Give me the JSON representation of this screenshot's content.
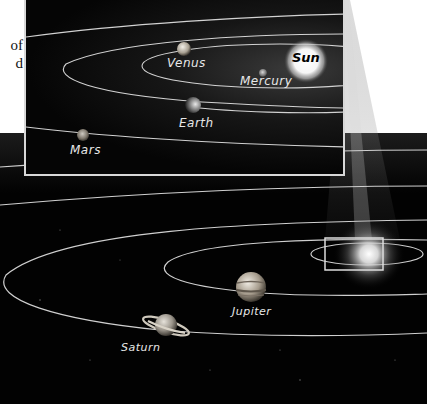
{
  "page_text": {
    "line1": "of",
    "line2": "d"
  },
  "inset": {
    "title": "Inner solar system",
    "labels": {
      "sun": "Sun",
      "mercury": "Mercury",
      "venus": "Venus",
      "earth": "Earth",
      "mars": "Mars"
    }
  },
  "outer": {
    "labels": {
      "jupiter": "Jupiter",
      "saturn": "Saturn"
    }
  },
  "colors": {
    "background": "#ffffff",
    "space": "#020202",
    "orbit": "#cfcfcf",
    "inset_border": "#d8d8d8",
    "sun_glow": "#ffffff"
  }
}
